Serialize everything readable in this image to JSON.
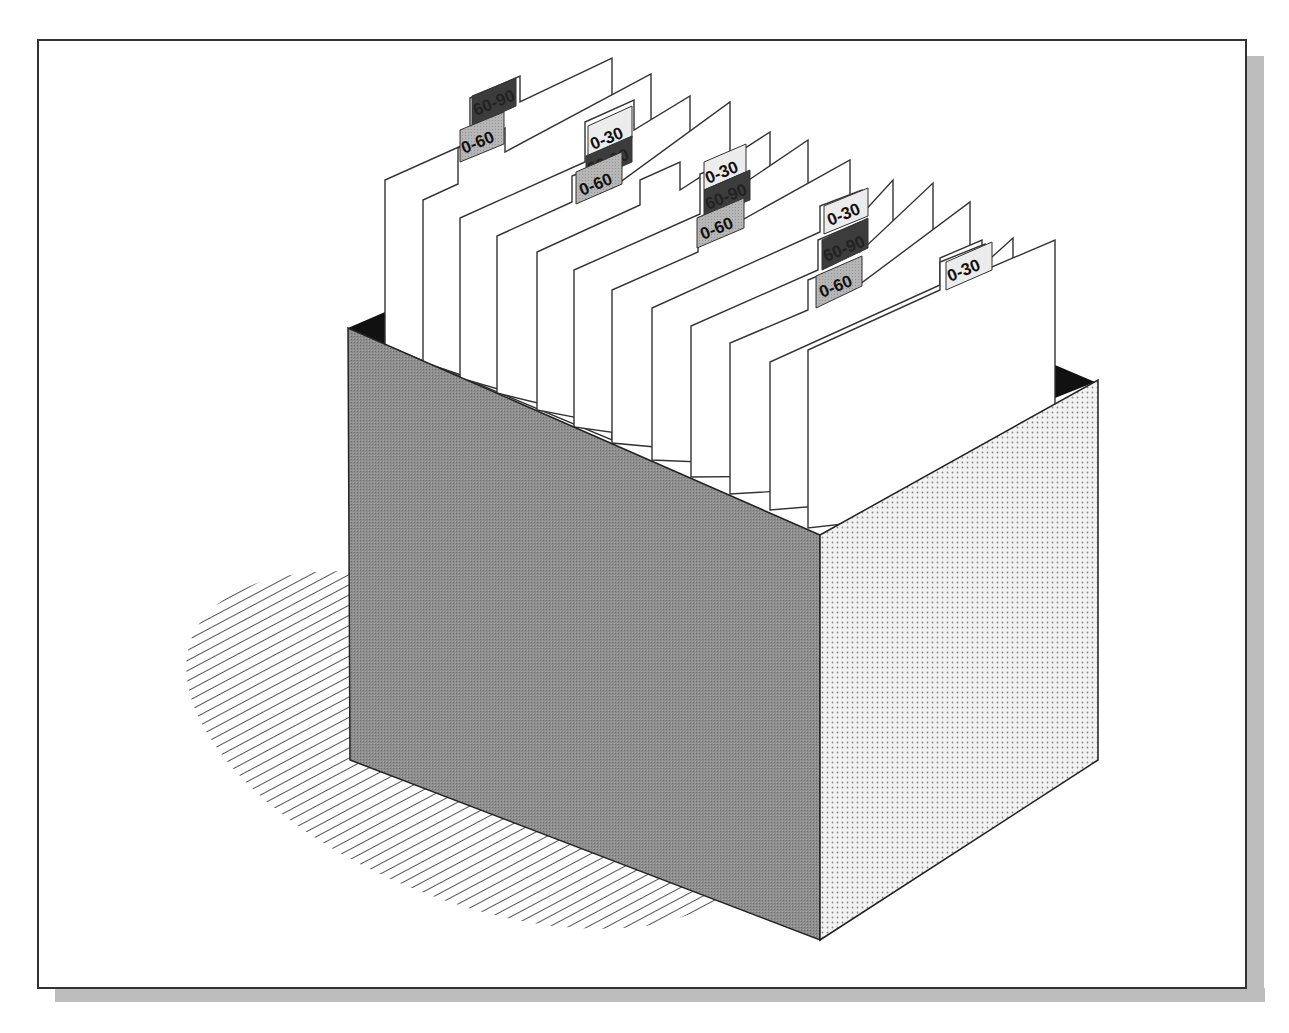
{
  "illustration": {
    "subject": "file box with index cards and aging tabs",
    "colors": {
      "frame_border": "#333333",
      "frame_shadow": "#b8b8b8",
      "box_front": "#8c8c8c",
      "box_side": "#e4e4e4",
      "box_interior": "#111111",
      "card_fill": "#ffffff",
      "card_stroke": "#333333",
      "tab_0_30": "#ececec",
      "tab_0_60": "#b4b4b4",
      "tab_60_90": "#3c3c3c",
      "shadow_hatch": "#555555"
    },
    "tabs": [
      {
        "label": "60-90",
        "kind": "tab_60_90"
      },
      {
        "label": "0-60",
        "kind": "tab_0_60"
      },
      {
        "label": "0-30",
        "kind": "tab_0_30"
      },
      {
        "label": "60-90",
        "kind": "tab_60_90"
      },
      {
        "label": "0-60",
        "kind": "tab_0_60"
      },
      {
        "label": "0-30",
        "kind": "tab_0_30"
      },
      {
        "label": "60-90",
        "kind": "tab_60_90"
      },
      {
        "label": "0-60",
        "kind": "tab_0_60"
      },
      {
        "label": "0-30",
        "kind": "tab_0_30"
      },
      {
        "label": "60-90",
        "kind": "tab_60_90"
      },
      {
        "label": "0-60",
        "kind": "tab_0_60"
      },
      {
        "label": "0-30",
        "kind": "tab_0_30"
      }
    ]
  }
}
